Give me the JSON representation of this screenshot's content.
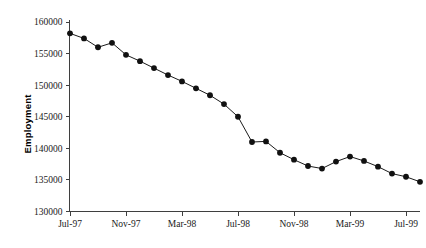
{
  "chart_data": {
    "type": "line",
    "title": "",
    "subtitle": "",
    "xlabel": "",
    "ylabel": "Employment",
    "ylim": [
      130000,
      160000
    ],
    "ytick_step": 5000,
    "yticks": [
      130000,
      135000,
      140000,
      145000,
      150000,
      155000,
      160000
    ],
    "ytick_labels": [
      "130000",
      "135000",
      "140000",
      "145000",
      "150000",
      "155000",
      "160000"
    ],
    "xticks": [
      "Jul-97",
      "Nov-97",
      "Mar-98",
      "Jul-98",
      "Nov-98",
      "Mar-99",
      "Jul-99"
    ],
    "xtick_interval_months": 4,
    "grid": false,
    "legend": null,
    "legend_position": "none",
    "marker": "filled-circle",
    "x": [
      "Jul-97",
      "Aug-97",
      "Sep-97",
      "Oct-97",
      "Nov-97",
      "Dec-97",
      "Jan-98",
      "Feb-98",
      "Mar-98",
      "Apr-98",
      "May-98",
      "Jun-98",
      "Jul-98",
      "Aug-98",
      "Sep-98",
      "Oct-98",
      "Nov-98",
      "Dec-98",
      "Jan-99",
      "Feb-99",
      "Mar-99",
      "Apr-99",
      "May-99",
      "Jun-99",
      "Jul-99",
      "Aug-99"
    ],
    "values": [
      158200,
      157400,
      156000,
      156700,
      154800,
      153800,
      152700,
      151600,
      150600,
      149500,
      148400,
      147000,
      145000,
      141000,
      141100,
      139300,
      138200,
      137200,
      136800,
      137900,
      138700,
      138000,
      137100,
      136000,
      135500,
      134700
    ],
    "series": [
      {
        "name": "Employment",
        "values": [
          158200,
          157400,
          156000,
          156700,
          154800,
          153800,
          152700,
          151600,
          150600,
          149500,
          148400,
          147000,
          145000,
          141000,
          141100,
          139300,
          138200,
          137200,
          136800,
          137900,
          138700,
          138000,
          137100,
          136000,
          135500,
          134700
        ],
        "color": "#111111"
      }
    ]
  },
  "caption": {
    "text": ""
  }
}
